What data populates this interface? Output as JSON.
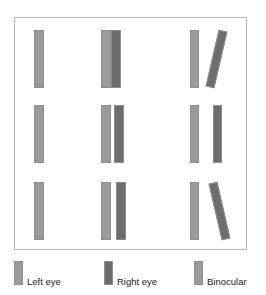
{
  "figure": {
    "title": "",
    "panel": {
      "background": "#ffffff",
      "border_color": "#b9b9b9"
    },
    "colors": {
      "left_eye": "#9b9b9b",
      "right_eye": "#6d6d6d",
      "binocular": "#9b9b9b",
      "bar_outline": "#8e8e8e"
    },
    "rows": [
      {
        "name": "row-1",
        "cells": [
          {
            "name": "cell-r1-c1",
            "description": "single light bar",
            "bars": [
              {
                "name": "bar-left-eye",
                "eye": "left_eye",
                "x": 33,
                "y": 29,
                "w": 10,
                "h": 58,
                "rotate": 0,
                "color": "#9b9b9b"
              }
            ]
          },
          {
            "name": "cell-r1-c2",
            "description": "two abutting bars, light and dark touching",
            "bars": [
              {
                "name": "bar-left-eye",
                "eye": "left_eye",
                "x": 100,
                "y": 29,
                "w": 10,
                "h": 58,
                "rotate": 0,
                "color": "#9b9b9b"
              },
              {
                "name": "bar-right-eye",
                "eye": "right_eye",
                "x": 110,
                "y": 29,
                "w": 10,
                "h": 58,
                "rotate": 0,
                "color": "#6d6d6d"
              }
            ]
          },
          {
            "name": "cell-r1-c3",
            "description": "vertical light bar plus tilted dark bar leaning right",
            "bars": [
              {
                "name": "bar-left-eye",
                "eye": "left_eye",
                "x": 189,
                "y": 29,
                "w": 9,
                "h": 58,
                "rotate": 0,
                "color": "#9b9b9b"
              },
              {
                "name": "bar-right-eye-tilted",
                "eye": "right_eye",
                "x": 211,
                "y": 29,
                "w": 9,
                "h": 58,
                "rotate": 13,
                "color": "#6d6d6d"
              }
            ]
          }
        ]
      },
      {
        "name": "row-2",
        "cells": [
          {
            "name": "cell-r2-c1",
            "description": "single light bar",
            "bars": [
              {
                "name": "bar-left-eye",
                "eye": "left_eye",
                "x": 33,
                "y": 104,
                "w": 10,
                "h": 58,
                "rotate": 0,
                "color": "#9b9b9b"
              }
            ]
          },
          {
            "name": "cell-r2-c2",
            "description": "two bars with a narrow gap",
            "bars": [
              {
                "name": "bar-left-eye",
                "eye": "left_eye",
                "x": 100,
                "y": 104,
                "w": 10,
                "h": 58,
                "rotate": 0,
                "color": "#9b9b9b"
              },
              {
                "name": "bar-right-eye",
                "eye": "right_eye",
                "x": 113,
                "y": 104,
                "w": 10,
                "h": 58,
                "rotate": 0,
                "color": "#6d6d6d"
              }
            ]
          },
          {
            "name": "cell-r2-c3",
            "description": "two vertical bars with a wide gap",
            "bars": [
              {
                "name": "bar-left-eye",
                "eye": "left_eye",
                "x": 189,
                "y": 104,
                "w": 9,
                "h": 58,
                "rotate": 0,
                "color": "#9b9b9b"
              },
              {
                "name": "bar-right-eye",
                "eye": "right_eye",
                "x": 212,
                "y": 104,
                "w": 9,
                "h": 58,
                "rotate": 0,
                "color": "#6d6d6d"
              }
            ]
          }
        ]
      },
      {
        "name": "row-3",
        "cells": [
          {
            "name": "cell-r3-c1",
            "description": "single light bar",
            "bars": [
              {
                "name": "bar-left-eye",
                "eye": "left_eye",
                "x": 33,
                "y": 181,
                "w": 10,
                "h": 58,
                "rotate": 0,
                "color": "#9b9b9b"
              }
            ]
          },
          {
            "name": "cell-r3-c2",
            "description": "two bars with a narrow gap",
            "bars": [
              {
                "name": "bar-left-eye",
                "eye": "left_eye",
                "x": 100,
                "y": 181,
                "w": 10,
                "h": 58,
                "rotate": 0,
                "color": "#9b9b9b"
              },
              {
                "name": "bar-right-eye",
                "eye": "right_eye",
                "x": 115,
                "y": 181,
                "w": 10,
                "h": 58,
                "rotate": 0,
                "color": "#6d6d6d"
              }
            ]
          },
          {
            "name": "cell-r3-c3",
            "description": "vertical light bar plus tilted dark bar leaning left",
            "bars": [
              {
                "name": "bar-left-eye",
                "eye": "left_eye",
                "x": 189,
                "y": 181,
                "w": 9,
                "h": 58,
                "rotate": 0,
                "color": "#9b9b9b"
              },
              {
                "name": "bar-right-eye-tilted",
                "eye": "right_eye",
                "x": 214,
                "y": 181,
                "w": 9,
                "h": 58,
                "rotate": -13,
                "color": "#6d6d6d"
              }
            ]
          }
        ]
      }
    ]
  },
  "legend": {
    "entries": [
      {
        "name": "legend-left-eye",
        "label": "Left eye",
        "color": "#9b9b9b",
        "x": 14
      },
      {
        "name": "legend-right-eye",
        "label": "Right eye",
        "color": "#6d6d6d",
        "x": 104
      },
      {
        "name": "legend-binocular",
        "label": "Binocular",
        "color": "#9b9b9b",
        "x": 194
      }
    ]
  }
}
